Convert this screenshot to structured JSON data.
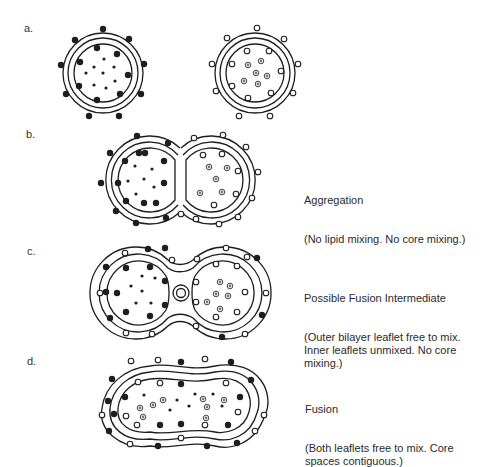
{
  "figure": {
    "panels": [
      {
        "id": "a",
        "label": "a.",
        "title": "",
        "description": ""
      },
      {
        "id": "b",
        "label": "b.",
        "title": "Aggregation",
        "description": "(No lipid mixing. No core mixing.)"
      },
      {
        "id": "c",
        "label": "c.",
        "title": "Possible Fusion Intermediate",
        "description": "(Outer bilayer leaflet free to mix.\nInner leaflets unmixed. No core\nmixing.)"
      },
      {
        "id": "d",
        "label": "d.",
        "title": "Fusion",
        "description": "(Both leaflets free to mix. Core\nspaces contiguous.)"
      }
    ],
    "legend_markers": {
      "black_lipid": "filled black circle (lipid label, vesicle 1)",
      "white_lipid": "open circle (lipid label, vesicle 2)",
      "small_dot": "small black dot (core content, vesicle 1)",
      "ringed_dot": "ringed grey dot (core content, vesicle 2)"
    },
    "colors": {
      "ink": "#1e1e1e",
      "grey_core": "#777777",
      "background": "#ffffff"
    }
  },
  "markers": {
    "a1_outer": [
      [
        103,
        29
      ],
      [
        75,
        40
      ],
      [
        129,
        39
      ],
      [
        61,
        65
      ],
      [
        144,
        64
      ],
      [
        66,
        94
      ],
      [
        141,
        94
      ],
      [
        89,
        116
      ],
      [
        119,
        116
      ]
    ],
    "a1_inner": [
      [
        97,
        48
      ],
      [
        117,
        54
      ],
      [
        80,
        62
      ],
      [
        128,
        75
      ],
      [
        79,
        86
      ],
      [
        120,
        94
      ],
      [
        97,
        100
      ]
    ],
    "a1_core": [
      [
        104,
        59
      ],
      [
        94,
        67
      ],
      [
        114,
        67
      ],
      [
        86,
        73
      ],
      [
        103,
        73
      ],
      [
        94,
        85
      ],
      [
        115,
        81
      ],
      [
        106,
        88
      ]
    ],
    "a2_outer": [
      [
        257,
        28
      ],
      [
        227,
        38
      ],
      [
        284,
        39
      ],
      [
        212,
        64
      ],
      [
        298,
        64
      ],
      [
        216,
        91
      ],
      [
        293,
        93
      ],
      [
        239,
        116
      ],
      [
        270,
        116
      ]
    ],
    "a2_inner": [
      [
        247,
        51
      ],
      [
        269,
        51
      ],
      [
        232,
        64
      ],
      [
        281,
        71
      ],
      [
        232,
        86
      ],
      [
        271,
        93
      ],
      [
        248,
        98
      ]
    ],
    "a2_core": [
      [
        248,
        65
      ],
      [
        261,
        61
      ],
      [
        256,
        73
      ],
      [
        267,
        76
      ],
      [
        244,
        81
      ],
      [
        258,
        84
      ]
    ],
    "b_black_outer": [
      [
        137,
        136
      ],
      [
        168,
        143
      ],
      [
        110,
        153
      ],
      [
        101,
        183
      ],
      [
        116,
        211
      ],
      [
        136,
        223
      ],
      [
        166,
        218
      ],
      [
        139,
        153
      ]
    ],
    "b_black_inner": [
      [
        125,
        161
      ],
      [
        145,
        153
      ],
      [
        164,
        161
      ],
      [
        118,
        183
      ],
      [
        164,
        183
      ],
      [
        126,
        201
      ],
      [
        144,
        203
      ],
      [
        156,
        203
      ]
    ],
    "b_black_core": [
      [
        135,
        166
      ],
      [
        152,
        169
      ],
      [
        128,
        181
      ],
      [
        144,
        179
      ],
      [
        136,
        194
      ],
      [
        154,
        187
      ]
    ],
    "b_white_outer": [
      [
        194,
        138
      ],
      [
        223,
        135
      ],
      [
        246,
        147
      ],
      [
        258,
        172
      ],
      [
        252,
        198
      ],
      [
        238,
        217
      ],
      [
        219,
        224
      ],
      [
        196,
        219
      ],
      [
        181,
        214
      ]
    ],
    "b_white_inner": [
      [
        203,
        155
      ],
      [
        222,
        154
      ],
      [
        238,
        171
      ],
      [
        236,
        194
      ],
      [
        214,
        205
      ]
    ],
    "b_white_core": [
      [
        209,
        167
      ],
      [
        227,
        168
      ],
      [
        216,
        179
      ],
      [
        200,
        193
      ],
      [
        222,
        192
      ]
    ],
    "c_black_outer": [
      [
        148,
        249
      ],
      [
        106,
        267
      ],
      [
        257,
        258
      ],
      [
        262,
        315
      ],
      [
        110,
        318
      ],
      [
        222,
        337
      ],
      [
        165,
        248
      ],
      [
        106,
        292
      ]
    ],
    "c_black_inner": [
      [
        126,
        268
      ],
      [
        150,
        267
      ],
      [
        117,
        293
      ],
      [
        165,
        281
      ],
      [
        126,
        312
      ],
      [
        150,
        316
      ],
      [
        165,
        305
      ]
    ],
    "c_black_core": [
      [
        142,
        276
      ],
      [
        155,
        278
      ],
      [
        131,
        286
      ],
      [
        142,
        291
      ],
      [
        136,
        303
      ],
      [
        151,
        303
      ]
    ],
    "c_white_outer": [
      [
        125,
        253
      ],
      [
        172,
        260
      ],
      [
        226,
        248
      ],
      [
        247,
        257
      ],
      [
        100,
        293
      ],
      [
        266,
        293
      ],
      [
        126,
        333
      ],
      [
        152,
        334
      ],
      [
        196,
        326
      ],
      [
        245,
        334
      ],
      [
        197,
        259
      ]
    ],
    "c_white_inner": [
      [
        216,
        264
      ],
      [
        237,
        266
      ],
      [
        196,
        282
      ],
      [
        245,
        292
      ],
      [
        196,
        302
      ],
      [
        237,
        312
      ],
      [
        216,
        317
      ]
    ],
    "c_white_core": [
      [
        220,
        282
      ],
      [
        230,
        286
      ],
      [
        216,
        294
      ],
      [
        228,
        296
      ],
      [
        207,
        302
      ],
      [
        220,
        309
      ]
    ],
    "d_black_outer": [
      [
        181,
        362
      ],
      [
        231,
        362
      ],
      [
        112,
        379
      ],
      [
        251,
        380
      ],
      [
        108,
        401
      ],
      [
        109,
        431
      ],
      [
        158,
        446
      ],
      [
        207,
        446
      ],
      [
        237,
        443
      ]
    ],
    "d_black_inner": [
      [
        181,
        384
      ],
      [
        125,
        397
      ],
      [
        240,
        397
      ],
      [
        160,
        425
      ],
      [
        181,
        424
      ],
      [
        228,
        425
      ],
      [
        114,
        414
      ]
    ],
    "d_white_outer": [
      [
        131,
        361
      ],
      [
        158,
        360
      ],
      [
        205,
        359
      ],
      [
        102,
        415
      ],
      [
        264,
        415
      ],
      [
        130,
        444
      ],
      [
        181,
        438
      ],
      [
        255,
        431
      ]
    ],
    "d_white_inner": [
      [
        138,
        382
      ],
      [
        160,
        383
      ],
      [
        226,
        383
      ],
      [
        126,
        416
      ],
      [
        238,
        412
      ],
      [
        137,
        425
      ],
      [
        205,
        425
      ]
    ],
    "d_core_small": [
      [
        144,
        395
      ],
      [
        177,
        400
      ],
      [
        195,
        394
      ],
      [
        213,
        394
      ],
      [
        170,
        410
      ],
      [
        189,
        406
      ],
      [
        222,
        406
      ]
    ],
    "d_core_ringed": [
      [
        163,
        400
      ],
      [
        153,
        405
      ],
      [
        140,
        408
      ],
      [
        143,
        417
      ],
      [
        203,
        399
      ],
      [
        207,
        407
      ],
      [
        206,
        418
      ],
      [
        224,
        400
      ]
    ]
  }
}
